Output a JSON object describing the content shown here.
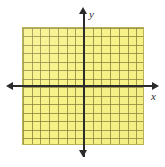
{
  "figure": {
    "kind": "coordinate-plane",
    "background_color": "#ffffff"
  },
  "grid": {
    "fill_color": "#f7f287",
    "line_color": "#827c38",
    "border_color": "#b9b356",
    "columns": 14,
    "rows": 14
  },
  "axes": {
    "color": "#2b2b2b",
    "x": {
      "label": "x",
      "arrow_left": "arrow-left",
      "arrow_right": "arrow-right"
    },
    "y": {
      "label": "y",
      "arrow_up": "arrow-up",
      "arrow_down": "arrow-down"
    }
  },
  "chart_data": {
    "type": "scatter",
    "title": "",
    "xlabel": "x",
    "ylabel": "y",
    "xlim": [
      -7,
      7
    ],
    "ylim": [
      -7,
      7
    ],
    "xticks": [
      -7,
      -6,
      -5,
      -4,
      -3,
      -2,
      -1,
      0,
      1,
      2,
      3,
      4,
      5,
      6,
      7
    ],
    "yticks": [
      -7,
      -6,
      -5,
      -4,
      -3,
      -2,
      -1,
      0,
      1,
      2,
      3,
      4,
      5,
      6,
      7
    ],
    "xtick_labels": [],
    "ytick_labels": [],
    "grid": true,
    "legend": null,
    "series": [],
    "annotations": []
  }
}
